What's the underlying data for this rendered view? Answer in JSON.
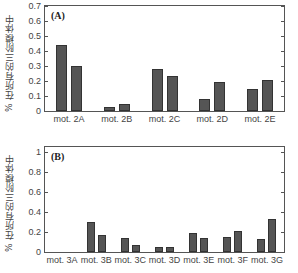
{
  "chart_data": [
    {
      "type": "bar",
      "panel_label": "(A)",
      "title": "",
      "ylabel": "% 在所有的三阶模体中",
      "xlabel": "",
      "ylim": [
        0,
        0.7
      ],
      "yticks": [
        "0",
        "0.1",
        "0.2",
        "0.3",
        "0.4",
        "0.5",
        "0.6",
        "0.7"
      ],
      "categories": [
        "mot. 2A",
        "mot. 2B",
        "mot. 2C",
        "mot. 2D",
        "mot. 2E"
      ],
      "series": [
        {
          "name": "series 1",
          "values": [
            0.44,
            0.03,
            0.28,
            0.08,
            0.15
          ]
        },
        {
          "name": "series 2",
          "values": [
            0.3,
            0.045,
            0.235,
            0.195,
            0.205
          ]
        }
      ],
      "grid": false,
      "legend": null,
      "bar_color": "#555555"
    },
    {
      "type": "bar",
      "panel_label": "(B)",
      "title": "",
      "ylabel": "% 在所有的三阶模体中",
      "xlabel": "",
      "ylim": [
        0,
        1.05
      ],
      "yticks": [
        "0",
        "0.2",
        "0.4",
        "0.6",
        "0.8",
        "1"
      ],
      "categories": [
        "mot. 3A",
        "mot. 3B",
        "mot. 3C",
        "mot. 3D",
        "mot. 3E",
        "mot. 3F",
        "mot. 3G"
      ],
      "series": [
        {
          "name": "series 1",
          "values": [
            0.0,
            0.3,
            0.14,
            0.05,
            0.19,
            0.15,
            0.13
          ]
        },
        {
          "name": "series 2",
          "values": [
            0.0,
            0.17,
            0.07,
            0.05,
            0.14,
            0.21,
            0.33
          ]
        }
      ],
      "grid": false,
      "legend": null,
      "bar_color": "#555555"
    }
  ]
}
